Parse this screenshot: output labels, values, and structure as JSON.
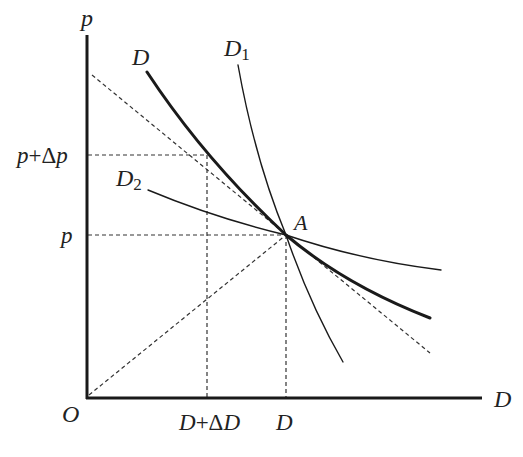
{
  "diagram": {
    "type": "economics demand elasticity diagram",
    "axes": {
      "y_label": "p",
      "x_label": "D",
      "origin_label": "O"
    },
    "tick_labels": {
      "y": [
        {
          "label": "p+Δp",
          "parts": [
            "p",
            "+Δ",
            "p"
          ]
        },
        {
          "label": "p",
          "parts": [
            "p"
          ]
        }
      ],
      "x": [
        {
          "label": "D+ΔD",
          "parts": [
            "D",
            "+Δ",
            "D"
          ]
        },
        {
          "label": "D",
          "parts": [
            "D"
          ]
        }
      ]
    },
    "curves": [
      {
        "name": "D",
        "label_main": "D",
        "label_sub": "",
        "style": "thick solid"
      },
      {
        "name": "D1",
        "label_main": "D",
        "label_sub": "1",
        "style": "thin solid, steep"
      },
      {
        "name": "D2",
        "label_main": "D",
        "label_sub": "2",
        "style": "thin solid, flat"
      }
    ],
    "point": {
      "label": "A"
    },
    "guides": [
      "dashed tangent line to D at A",
      "dashed ray from O through A",
      "dashed horizontal at p",
      "dashed horizontal at p+Δp",
      "dashed vertical at D",
      "dashed vertical at D+ΔD"
    ],
    "colors": {
      "line": "#1a1a1a",
      "background": "#ffffff"
    }
  }
}
